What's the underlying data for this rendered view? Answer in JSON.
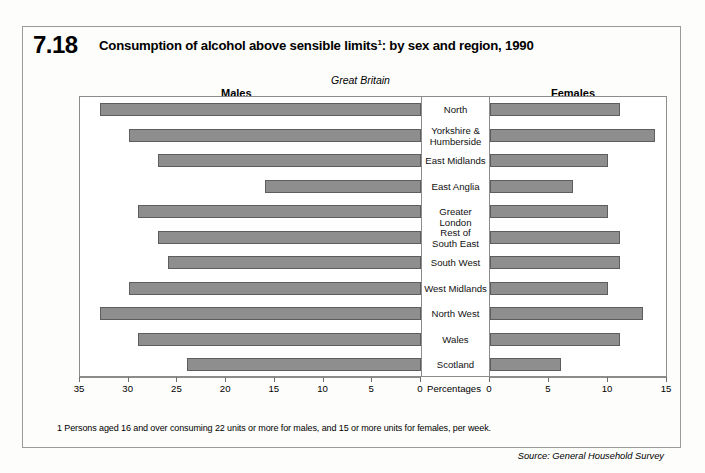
{
  "figure": {
    "number": "7.18",
    "title_main": "Consumption of alcohol above sensible limits",
    "title_sup": "1",
    "title_rest": ": by sex and region, 1990",
    "region_note": "Great Britain",
    "left_panel_label": "Males",
    "right_panel_label": "Females",
    "center_axis_label": "Percentages",
    "footnote": "1  Persons aged 16 and over consuming 22 units or more for males, and 15 or more units for females, per week.",
    "source": "Source: General Household Survey"
  },
  "colors": {
    "bar_fill": "#8e8e8e",
    "bar_border": "#5d5d5d",
    "frame": "#9a9a9a",
    "background": "#fdfdfb"
  },
  "chart_data": {
    "type": "bar",
    "subtitle": "Great Britain",
    "orientation": "horizontal",
    "layout": "bidirectional-pyramid",
    "xlabel": "Percentages",
    "ylabel": "",
    "grid": false,
    "legend_position": "top-outside",
    "categories": [
      "North",
      "Yorkshire &\nHumberside",
      "East Midlands",
      "East Anglia",
      "Greater London",
      "Rest of\nSouth East",
      "South West",
      "West Midlands",
      "North West",
      "Wales",
      "Scotland"
    ],
    "series": [
      {
        "name": "Males",
        "axis": "left",
        "xlim": [
          0,
          35
        ],
        "xticks": [
          35,
          30,
          25,
          20,
          15,
          10,
          5,
          0
        ],
        "values": [
          33,
          30,
          27,
          16,
          29,
          27,
          26,
          30,
          33,
          29,
          24
        ]
      },
      {
        "name": "Females",
        "axis": "right",
        "xlim": [
          0,
          15
        ],
        "xticks": [
          0,
          5,
          10,
          15
        ],
        "values": [
          11,
          14,
          10,
          7,
          10,
          11,
          11,
          10,
          13,
          11,
          6
        ]
      }
    ]
  }
}
